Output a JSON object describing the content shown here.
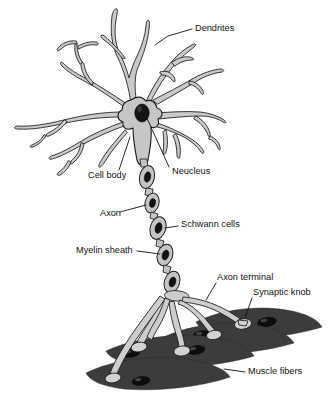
{
  "figure": {
    "background_color": "#ffffff",
    "width": 330,
    "height": 404
  },
  "palette": {
    "cell_fill": "#c9c9c9",
    "outline": "#1a1a1a",
    "nucleus_fill": "#141414",
    "muscle_fill": "#3c3c3c",
    "knob_fill": "#d2d2d2",
    "label_color": "#111111"
  },
  "labels": {
    "dendrites": "Dendrites",
    "cell_body": "Cell body",
    "nucleus": "Neucleus",
    "axon": "Axon",
    "schwann_cells": "Schwann cells",
    "myelin_sheath": "Myelin sheath",
    "axon_terminal": "Axon terminal",
    "synaptic_knob": "Synaptic knob",
    "muscle_fibers": "Muscle fibers"
  },
  "parts": [
    {
      "id": "dendrites",
      "label": "Dendrites",
      "description": "Branching tapered processes radiating from the cell body",
      "label_x": 195,
      "label_y": 29,
      "anchor_x": 155,
      "anchor_y": 44
    },
    {
      "id": "cell-body",
      "label": "Cell body",
      "description": "Soma: grey polygonal body at the convergence of the dendrites",
      "label_x": 88,
      "label_y": 176,
      "anchor_x": 136,
      "anchor_y": 126
    },
    {
      "id": "nucleus",
      "label": "Neucleus",
      "description": "Dark oval nucleus inside the cell body",
      "label_x": 172,
      "label_y": 172,
      "anchor_x": 146,
      "anchor_y": 113
    },
    {
      "id": "axon",
      "label": "Axon",
      "description": "Long fibre projecting downward from the cell body",
      "label_x": 100,
      "label_y": 214,
      "anchor_x": 152,
      "anchor_y": 208
    },
    {
      "id": "schwann-cells",
      "label": "Schwann cells",
      "description": "Cells wrapping the axon, each with a dark nucleus",
      "label_x": 181,
      "label_y": 225,
      "anchor_x": 163,
      "anchor_y": 226
    },
    {
      "id": "myelin-sheath",
      "label": "Myelin sheath",
      "description": "Insulating segments along the axon between nodes",
      "label_x": 76,
      "label_y": 251,
      "anchor_x": 166,
      "anchor_y": 252
    },
    {
      "id": "axon-terminal",
      "label": "Axon terminal",
      "description": "Fine branches at the end of the axon",
      "label_x": 217,
      "label_y": 278,
      "anchor_x": 207,
      "anchor_y": 300
    },
    {
      "id": "synaptic-knob",
      "label": "Synaptic knob",
      "description": "Bulb at each terminal branch contacting a muscle fiber",
      "label_x": 253,
      "label_y": 293,
      "anchor_x": 245,
      "anchor_y": 322
    },
    {
      "id": "muscle-fibers",
      "label": "Muscle fibers",
      "description": "Dark spindle-shaped fibers innervated by the terminals",
      "label_x": 248,
      "label_y": 372,
      "anchor_x": 222,
      "anchor_y": 369
    }
  ]
}
